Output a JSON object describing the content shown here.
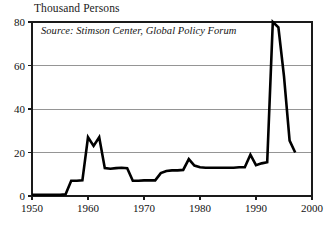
{
  "chart_data": {
    "type": "line",
    "title": "Thousand Persons",
    "subtitle": "",
    "xlabel": "",
    "ylabel": "Thousand Persons",
    "annotation": "Source: Stimson Center, Global Policy Forum",
    "grid": true,
    "legend": false,
    "xlim": [
      1950,
      2000
    ],
    "ylim": [
      0,
      80
    ],
    "xticks": [
      1950,
      1960,
      1970,
      1980,
      1990,
      2000
    ],
    "xtick_labels": [
      "1950",
      "1960",
      "1970",
      "1980",
      "1990",
      "2000"
    ],
    "yticks": [
      0,
      20,
      40,
      60,
      80
    ],
    "ytick_labels": [
      "0",
      "20",
      "40",
      "60",
      "80"
    ],
    "series": [
      {
        "name": "UN peacekeeping personnel",
        "color": "#000000",
        "x": [
          1950,
          1951,
          1952,
          1953,
          1954,
          1955,
          1956,
          1957,
          1958,
          1959,
          1960,
          1961,
          1962,
          1963,
          1964,
          1965,
          1966,
          1967,
          1968,
          1969,
          1970,
          1971,
          1972,
          1973,
          1974,
          1975,
          1976,
          1977,
          1978,
          1979,
          1980,
          1981,
          1982,
          1983,
          1984,
          1985,
          1986,
          1987,
          1988,
          1989,
          1990,
          1991,
          1992,
          1993,
          1994,
          1995,
          1996,
          1997
        ],
        "values": [
          0.6,
          0.6,
          0.6,
          0.6,
          0.6,
          0.6,
          0.8,
          7.0,
          7.0,
          7.2,
          27.0,
          23.0,
          27.0,
          12.8,
          12.5,
          12.8,
          13.0,
          12.8,
          7.0,
          7.0,
          7.2,
          7.2,
          7.2,
          10.5,
          11.5,
          11.8,
          11.8,
          12.0,
          17.0,
          14.0,
          13.2,
          13.0,
          13.0,
          13.0,
          13.0,
          13.0,
          13.0,
          13.2,
          13.2,
          19.0,
          14.2,
          15.0,
          15.5,
          80.0,
          77.5,
          55.0,
          25.5,
          20.0
        ]
      }
    ]
  },
  "chart_meta": {
    "axis_title_text": "Thousand Persons",
    "source_text": "Source: Stimson Center, Global Policy Forum",
    "line_color": "#000000",
    "grid_color": "#8a8a8a",
    "frame_color": "#1a1a1a",
    "background_color": "#ffffff"
  }
}
